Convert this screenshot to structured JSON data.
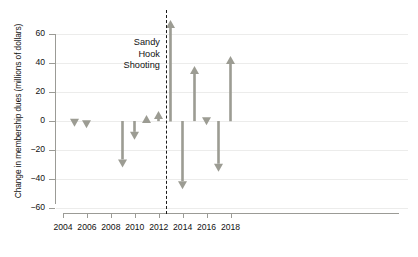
{
  "chart_data": {
    "type": "bar",
    "title": "",
    "subtitle": "",
    "xlabel": "",
    "ylabel": "Change in membership dues (millions of dollars)",
    "xlim": [
      2004,
      2018.7
    ],
    "ylim": [
      -60,
      70
    ],
    "yticks": [
      60,
      40,
      20,
      0,
      -20,
      -40,
      -60
    ],
    "ytick_labels": [
      "60",
      "40",
      "20",
      "0",
      "−20",
      "−40",
      "−60"
    ],
    "xticks": [
      2004,
      2006,
      2008,
      2010,
      2012,
      2014,
      2016,
      2018
    ],
    "xtick_labels": [
      "2004",
      "2006",
      "2008",
      "2010",
      "2012",
      "2014",
      "2016",
      "2018"
    ],
    "grid": true,
    "legend": null,
    "series_color": "#9c9c93",
    "categories": [
      2005,
      2006,
      2009,
      2010,
      2011,
      2012,
      2013,
      2014,
      2015,
      2016,
      2017,
      2018
    ],
    "values": [
      -4,
      -5,
      -32,
      -13,
      4,
      7,
      70,
      -47,
      38,
      -3,
      -35,
      45
    ],
    "points": [
      {
        "x": 2005,
        "value": -4,
        "direction": "down"
      },
      {
        "x": 2006,
        "value": -5,
        "direction": "down"
      },
      {
        "x": 2009,
        "value": -32,
        "direction": "down"
      },
      {
        "x": 2010,
        "value": -13,
        "direction": "down"
      },
      {
        "x": 2011,
        "value": 4,
        "direction": "up"
      },
      {
        "x": 2012,
        "value": 7,
        "direction": "up"
      },
      {
        "x": 2013,
        "value": 70,
        "direction": "up"
      },
      {
        "x": 2014,
        "value": -47,
        "direction": "down"
      },
      {
        "x": 2015,
        "value": 38,
        "direction": "up"
      },
      {
        "x": 2016,
        "value": -3,
        "direction": "down"
      },
      {
        "x": 2017,
        "value": -35,
        "direction": "down"
      },
      {
        "x": 2018,
        "value": 45,
        "direction": "up"
      }
    ],
    "annotations": [
      {
        "name": "sandy-hook-shooting",
        "text_lines": [
          "Sandy",
          "Hook",
          "Shooting"
        ],
        "x": 2012.6,
        "style": "dashed-vertical-line"
      }
    ]
  }
}
